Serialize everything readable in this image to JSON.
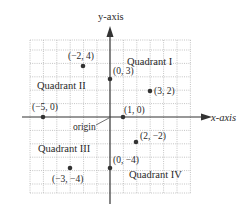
{
  "diagram": {
    "axes": {
      "x_label": "x-axis",
      "y_label": "y-axis",
      "origin_label": "origin",
      "x_range": [
        -6,
        6
      ],
      "y_range": [
        -5.7,
        5.8
      ]
    },
    "quadrants": [
      {
        "label": "Quadrant I"
      },
      {
        "label": "Quadrant II"
      },
      {
        "label": "Quadrant III"
      },
      {
        "label": "Quadrant IV"
      }
    ],
    "points": [
      {
        "x": -2,
        "y": 4,
        "label": "(−2, 4)"
      },
      {
        "x": 0,
        "y": 3,
        "label": "(0, 3)"
      },
      {
        "x": 3,
        "y": 2,
        "label": "(3, 2)"
      },
      {
        "x": -5,
        "y": 0,
        "label": "(−5, 0)"
      },
      {
        "x": 1,
        "y": 0,
        "label": "(1, 0)"
      },
      {
        "x": 2,
        "y": -2,
        "label": "(2, −2)"
      },
      {
        "x": 0,
        "y": -4,
        "label": "(0, −4)"
      },
      {
        "x": -3,
        "y": -4,
        "label": "(−3, −4)"
      }
    ],
    "colors": {
      "axis": "#333333",
      "grid": "#b0b0b0",
      "point": "#333333"
    }
  }
}
